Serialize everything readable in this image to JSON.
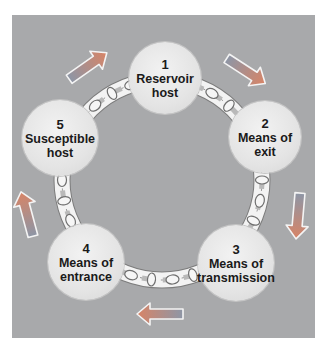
{
  "diagram": {
    "colors": {
      "panel": "#a8a9ab",
      "node_fill": "#e6e6e6",
      "chain": "#f4f4f4",
      "chain_outline": "#7a7a7a",
      "arrow_start": "#8d96a6",
      "arrow_end": "#d88466"
    },
    "nodes": [
      {
        "num": "1",
        "line1": "Reservoir",
        "line2": "host"
      },
      {
        "num": "2",
        "line1": "Means of",
        "line2": "exit"
      },
      {
        "num": "3",
        "line1": "Means of",
        "line2": "transmission"
      },
      {
        "num": "4",
        "line1": "Means of",
        "line2": "entrance"
      },
      {
        "num": "5",
        "line1": "Susceptible",
        "line2": "host"
      }
    ],
    "arrows": [
      {
        "from": "5",
        "to": "1",
        "direction": "up-right",
        "icon": "arrow-icon"
      },
      {
        "from": "1",
        "to": "2",
        "direction": "down-right",
        "icon": "arrow-icon"
      },
      {
        "from": "2",
        "to": "3",
        "direction": "down",
        "icon": "arrow-icon"
      },
      {
        "from": "3",
        "to": "4",
        "direction": "left",
        "icon": "arrow-icon"
      },
      {
        "from": "4",
        "to": "5",
        "direction": "up",
        "icon": "arrow-icon"
      }
    ]
  }
}
